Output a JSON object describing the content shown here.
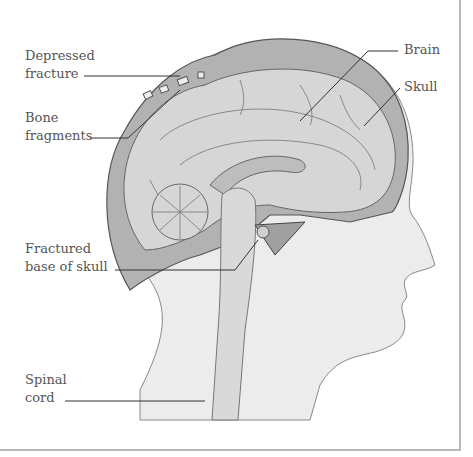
{
  "figure": {
    "labels": [
      {
        "id": "depressed-fracture",
        "lines": [
          "Depressed",
          "fracture"
        ]
      },
      {
        "id": "bone-fragments",
        "lines": [
          "Bone",
          "fragments"
        ]
      },
      {
        "id": "fractured-base",
        "lines": [
          "Fractured",
          "base of skull"
        ]
      },
      {
        "id": "spinal-cord",
        "lines": [
          "Spinal",
          "cord"
        ]
      },
      {
        "id": "brain",
        "lines": [
          "Brain"
        ]
      },
      {
        "id": "skull",
        "lines": [
          "Skull"
        ]
      }
    ]
  },
  "colors": {
    "head_fill": "#ececec",
    "brain_fill": "#d6d6d6",
    "skull_fill": "#a9a9a9",
    "outline": "#666666",
    "leader": "#333333",
    "frame": "#b8b8b8",
    "text": "#555555"
  }
}
